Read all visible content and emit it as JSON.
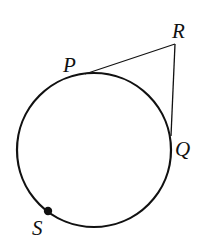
{
  "diagram": {
    "type": "geometry",
    "stroke_color": "#111111",
    "background": "#ffffff",
    "circle": {
      "cx": 94,
      "cy": 150,
      "r": 77
    },
    "points": {
      "P": {
        "label": "P",
        "x": 85,
        "y": 74,
        "label_x": 63,
        "label_y": 72
      },
      "Q": {
        "label": "Q",
        "x": 171,
        "y": 136,
        "label_x": 175,
        "label_y": 156
      },
      "R": {
        "label": "R",
        "x": 175,
        "y": 44,
        "label_x": 172,
        "label_y": 38
      },
      "S": {
        "label": "S",
        "x": 48,
        "y": 211,
        "label_x": 32,
        "label_y": 235
      }
    },
    "segments": [
      {
        "from": "P",
        "to": "R",
        "name": "tangent-PR"
      },
      {
        "from": "R",
        "to": "Q",
        "name": "tangent-RQ"
      }
    ],
    "marked_points": [
      "S"
    ]
  }
}
